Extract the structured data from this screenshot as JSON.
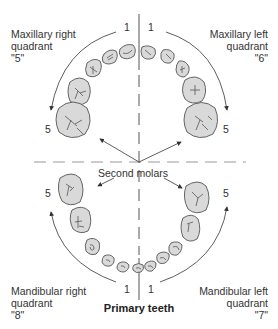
{
  "title": "Primary teeth",
  "center_label": "Second molars",
  "quadrants": {
    "maxillary_right": {
      "line1": "Maxillary right",
      "line2": "quadrant",
      "code": "\"5\"",
      "start": "1",
      "end": "5"
    },
    "maxillary_left": {
      "line1": "Maxillary left",
      "line2": "quadrant",
      "code": "\"6\"",
      "start": "1",
      "end": "5"
    },
    "mandibular_right": {
      "line1": "Mandibular right",
      "line2": "quadrant",
      "code": "\"8\"",
      "start": "1",
      "end": "5"
    },
    "mandibular_left": {
      "line1": "Mandibular left",
      "line2": "quadrant",
      "code": "\"7\"",
      "start": "1",
      "end": "5"
    }
  },
  "colors": {
    "tooth_fill": "#d9d9d9",
    "outline": "#555555",
    "dash": "#999999"
  }
}
